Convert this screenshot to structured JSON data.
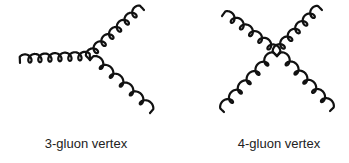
{
  "diagram": {
    "type": "feynman-vertices",
    "colors": {
      "line": "#111111",
      "text": "#222222",
      "background": "#ffffff"
    },
    "vertices": [
      {
        "id": "three-gluon",
        "label": "3-gluon vertex",
        "gluon_count": 3,
        "legs": [
          {
            "name": "left",
            "coils": 7
          },
          {
            "name": "upper-right",
            "coils": 7
          },
          {
            "name": "lower-right",
            "coils": 6
          }
        ]
      },
      {
        "id": "four-gluon",
        "label": "4-gluon vertex",
        "gluon_count": 4,
        "legs": [
          {
            "name": "upper-left",
            "coils": 6
          },
          {
            "name": "upper-right",
            "coils": 6
          },
          {
            "name": "lower-left",
            "coils": 6
          },
          {
            "name": "lower-right",
            "coils": 6
          }
        ]
      }
    ]
  }
}
